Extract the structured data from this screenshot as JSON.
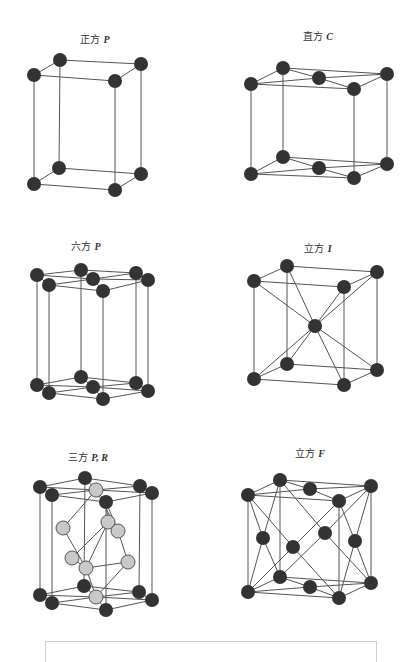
{
  "colors": {
    "bond": "#555555",
    "atom_dark": "#333333",
    "atom_light": "#c8c8c8",
    "atom_light_stroke": "#555555"
  },
  "atom_radius": 7,
  "panels": [
    {
      "id": "tetragonal-p",
      "label_cn": "正方",
      "label_sym": "P",
      "label_pos": [
        95,
        38
      ],
      "atoms": [
        [
          34,
          75,
          "d"
        ],
        [
          60,
          60,
          "d"
        ],
        [
          141,
          64,
          "d"
        ],
        [
          115,
          81,
          "d"
        ],
        [
          34,
          184,
          "d"
        ],
        [
          59,
          168,
          "d"
        ],
        [
          141,
          174,
          "d"
        ],
        [
          115,
          190,
          "d"
        ]
      ],
      "bonds": [
        [
          0,
          1
        ],
        [
          1,
          2
        ],
        [
          2,
          3
        ],
        [
          3,
          0
        ],
        [
          4,
          5
        ],
        [
          5,
          6
        ],
        [
          6,
          7
        ],
        [
          7,
          4
        ],
        [
          0,
          4
        ],
        [
          1,
          5
        ],
        [
          2,
          6
        ],
        [
          3,
          7
        ]
      ]
    },
    {
      "id": "orthorhombic-c",
      "label_cn": "直方",
      "label_sym": "C",
      "label_pos": [
        318,
        35
      ],
      "atoms": [
        [
          251,
          84,
          "d"
        ],
        [
          283,
          68,
          "d"
        ],
        [
          387,
          74,
          "d"
        ],
        [
          354,
          89,
          "d"
        ],
        [
          319,
          78,
          "d"
        ],
        [
          251,
          174,
          "d"
        ],
        [
          283,
          157,
          "d"
        ],
        [
          387,
          164,
          "d"
        ],
        [
          354,
          178,
          "d"
        ],
        [
          319,
          168,
          "d"
        ]
      ],
      "bonds": [
        [
          0,
          1
        ],
        [
          1,
          2
        ],
        [
          2,
          3
        ],
        [
          3,
          0
        ],
        [
          0,
          4
        ],
        [
          1,
          4
        ],
        [
          2,
          4
        ],
        [
          3,
          4
        ],
        [
          5,
          6
        ],
        [
          6,
          7
        ],
        [
          7,
          8
        ],
        [
          8,
          5
        ],
        [
          5,
          9
        ],
        [
          6,
          9
        ],
        [
          7,
          9
        ],
        [
          8,
          9
        ],
        [
          0,
          5
        ],
        [
          1,
          6
        ],
        [
          2,
          7
        ],
        [
          3,
          8
        ]
      ]
    },
    {
      "id": "hexagonal-p",
      "label_cn": "六方",
      "label_sym": "P",
      "label_pos": [
        86,
        245
      ],
      "atoms": [
        [
          37,
          275,
          "d"
        ],
        [
          81,
          270,
          "d"
        ],
        [
          136,
          273,
          "d"
        ],
        [
          148,
          280,
          "d"
        ],
        [
          103,
          291,
          "d"
        ],
        [
          49,
          285,
          "d"
        ],
        [
          93,
          279,
          "d"
        ],
        [
          37,
          385,
          "d"
        ],
        [
          81,
          377,
          "d"
        ],
        [
          136,
          383,
          "d"
        ],
        [
          148,
          391,
          "d"
        ],
        [
          103,
          399,
          "d"
        ],
        [
          49,
          393,
          "d"
        ],
        [
          93,
          387,
          "d"
        ]
      ],
      "bonds": [
        [
          0,
          1
        ],
        [
          1,
          2
        ],
        [
          2,
          3
        ],
        [
          3,
          4
        ],
        [
          4,
          5
        ],
        [
          5,
          0
        ],
        [
          0,
          6
        ],
        [
          1,
          6
        ],
        [
          2,
          6
        ],
        [
          3,
          6
        ],
        [
          4,
          6
        ],
        [
          5,
          6
        ],
        [
          7,
          8
        ],
        [
          8,
          9
        ],
        [
          9,
          10
        ],
        [
          10,
          11
        ],
        [
          11,
          12
        ],
        [
          12,
          7
        ],
        [
          7,
          13
        ],
        [
          8,
          13
        ],
        [
          9,
          13
        ],
        [
          10,
          13
        ],
        [
          11,
          13
        ],
        [
          12,
          13
        ],
        [
          0,
          7
        ],
        [
          1,
          8
        ],
        [
          2,
          9
        ],
        [
          3,
          10
        ],
        [
          4,
          11
        ],
        [
          5,
          12
        ]
      ]
    },
    {
      "id": "cubic-i",
      "label_cn": "立方",
      "label_sym": "I",
      "label_pos": [
        318,
        247
      ],
      "atoms": [
        [
          254,
          281,
          "d"
        ],
        [
          287,
          266,
          "d"
        ],
        [
          377,
          272,
          "d"
        ],
        [
          344,
          287,
          "d"
        ],
        [
          254,
          379,
          "d"
        ],
        [
          287,
          364,
          "d"
        ],
        [
          377,
          370,
          "d"
        ],
        [
          344,
          385,
          "d"
        ],
        [
          315,
          326,
          "d"
        ]
      ],
      "bonds": [
        [
          0,
          1
        ],
        [
          1,
          2
        ],
        [
          2,
          3
        ],
        [
          3,
          0
        ],
        [
          4,
          5
        ],
        [
          5,
          6
        ],
        [
          6,
          7
        ],
        [
          7,
          4
        ],
        [
          0,
          4
        ],
        [
          1,
          5
        ],
        [
          2,
          6
        ],
        [
          3,
          7
        ],
        [
          0,
          8
        ],
        [
          1,
          8
        ],
        [
          2,
          8
        ],
        [
          3,
          8
        ],
        [
          4,
          8
        ],
        [
          5,
          8
        ],
        [
          6,
          8
        ],
        [
          7,
          8
        ]
      ]
    },
    {
      "id": "trigonal-pr",
      "label_cn": "三方",
      "label_sym": "P, R",
      "label_pos": [
        88,
        456
      ],
      "atoms": [
        [
          40,
          487,
          "d"
        ],
        [
          85,
          478,
          "d"
        ],
        [
          140,
          486,
          "d"
        ],
        [
          152,
          493,
          "d"
        ],
        [
          106,
          502,
          "d"
        ],
        [
          52,
          495,
          "d"
        ],
        [
          40,
          595,
          "d"
        ],
        [
          84,
          586,
          "d"
        ],
        [
          139,
          592,
          "d"
        ],
        [
          152,
          600,
          "d"
        ],
        [
          106,
          610,
          "d"
        ],
        [
          52,
          603,
          "d"
        ],
        [
          96,
          490,
          "l"
        ],
        [
          63,
          528,
          "l"
        ],
        [
          108,
          522,
          "l"
        ],
        [
          118,
          531,
          "l"
        ],
        [
          72,
          558,
          "l"
        ],
        [
          86,
          568,
          "l"
        ],
        [
          128,
          562,
          "l"
        ],
        [
          96,
          597,
          "l"
        ]
      ],
      "bonds": [
        [
          0,
          1
        ],
        [
          1,
          2
        ],
        [
          2,
          3
        ],
        [
          3,
          4
        ],
        [
          4,
          5
        ],
        [
          5,
          0
        ],
        [
          0,
          12
        ],
        [
          1,
          12
        ],
        [
          2,
          12
        ],
        [
          3,
          12
        ],
        [
          4,
          12
        ],
        [
          5,
          12
        ],
        [
          6,
          7
        ],
        [
          7,
          8
        ],
        [
          8,
          9
        ],
        [
          9,
          10
        ],
        [
          10,
          11
        ],
        [
          11,
          6
        ],
        [
          6,
          19
        ],
        [
          7,
          19
        ],
        [
          8,
          19
        ],
        [
          9,
          19
        ],
        [
          10,
          19
        ],
        [
          11,
          19
        ],
        [
          0,
          6
        ],
        [
          1,
          7
        ],
        [
          2,
          8
        ],
        [
          3,
          9
        ],
        [
          4,
          10
        ],
        [
          5,
          11
        ],
        [
          12,
          13
        ],
        [
          12,
          15
        ],
        [
          4,
          14
        ],
        [
          13,
          17
        ],
        [
          14,
          16
        ],
        [
          15,
          18
        ],
        [
          16,
          17
        ],
        [
          17,
          18
        ],
        [
          14,
          17
        ],
        [
          18,
          19
        ],
        [
          17,
          19
        ],
        [
          4,
          15
        ]
      ]
    },
    {
      "id": "cubic-f",
      "label_cn": "立方",
      "label_sym": "F",
      "label_pos": [
        310,
        452
      ],
      "atoms": [
        [
          248,
          495,
          "d"
        ],
        [
          280,
          480,
          "d"
        ],
        [
          371,
          486,
          "d"
        ],
        [
          339,
          501,
          "d"
        ],
        [
          248,
          592,
          "d"
        ],
        [
          280,
          577,
          "d"
        ],
        [
          371,
          583,
          "d"
        ],
        [
          339,
          598,
          "d"
        ],
        [
          310,
          489,
          "d"
        ],
        [
          310,
          587,
          "d"
        ],
        [
          263,
          538,
          "d"
        ],
        [
          355,
          541,
          "d"
        ],
        [
          293,
          547,
          "d"
        ],
        [
          325,
          533,
          "d"
        ]
      ],
      "bonds": [
        [
          0,
          1
        ],
        [
          1,
          2
        ],
        [
          2,
          3
        ],
        [
          3,
          0
        ],
        [
          4,
          5
        ],
        [
          5,
          6
        ],
        [
          6,
          7
        ],
        [
          7,
          4
        ],
        [
          0,
          4
        ],
        [
          1,
          5
        ],
        [
          2,
          6
        ],
        [
          3,
          7
        ],
        [
          0,
          8
        ],
        [
          1,
          8
        ],
        [
          2,
          8
        ],
        [
          3,
          8
        ],
        [
          4,
          9
        ],
        [
          5,
          9
        ],
        [
          6,
          9
        ],
        [
          7,
          9
        ],
        [
          0,
          10
        ],
        [
          1,
          10
        ],
        [
          4,
          10
        ],
        [
          5,
          10
        ],
        [
          2,
          11
        ],
        [
          3,
          11
        ],
        [
          6,
          11
        ],
        [
          7,
          11
        ],
        [
          0,
          12
        ],
        [
          3,
          12
        ],
        [
          4,
          12
        ],
        [
          7,
          12
        ],
        [
          1,
          13
        ],
        [
          2,
          13
        ],
        [
          5,
          13
        ],
        [
          6,
          13
        ]
      ]
    }
  ],
  "answer_box": {
    "text": ""
  }
}
